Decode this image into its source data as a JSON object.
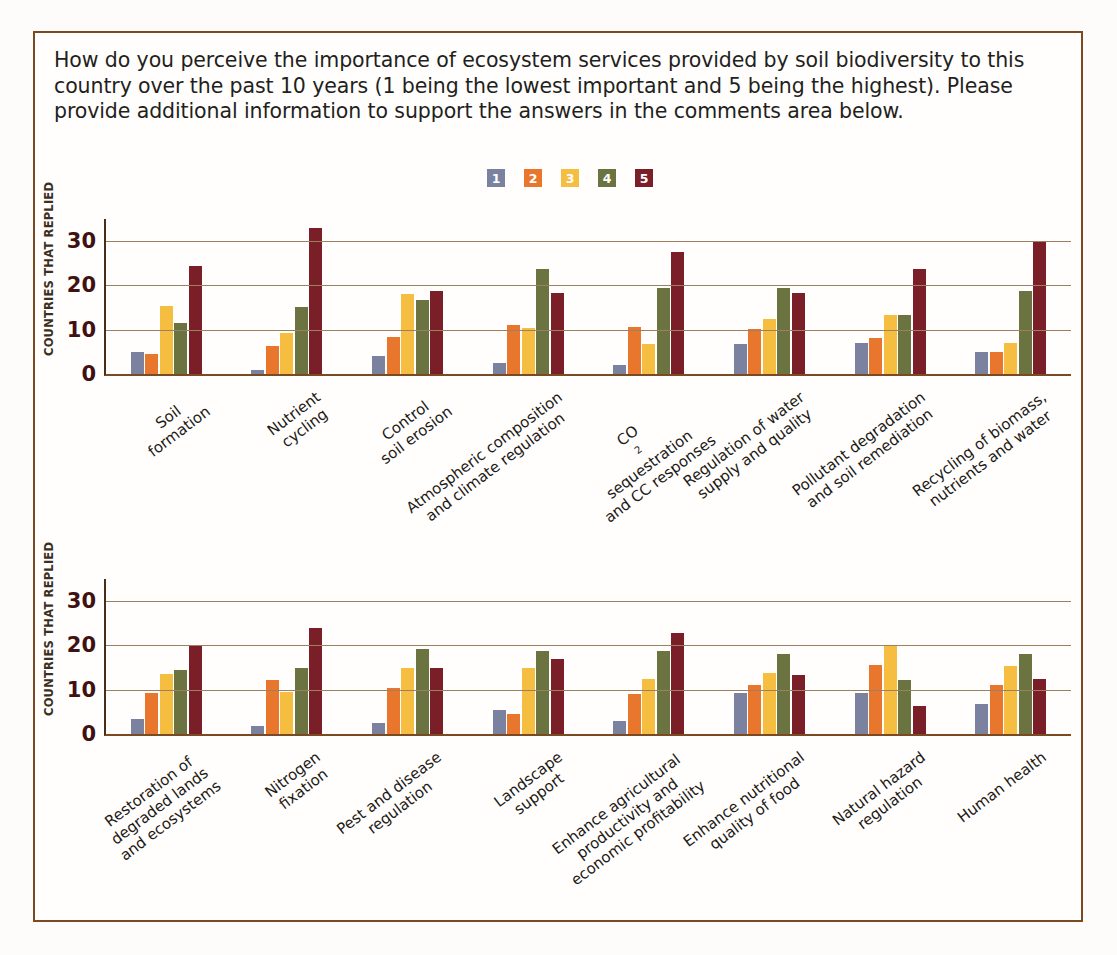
{
  "question": "How do you perceive the importance of ecosystem services provided by soil biodiversity to this country over the past 10 years (1 being the lowest important and 5 being the highest). Please provide additional information to support the answers in the comments area below.",
  "legend": {
    "entries": [
      {
        "label": "1",
        "color": "#7b82a0"
      },
      {
        "label": "2",
        "color": "#e8762c"
      },
      {
        "label": "3",
        "color": "#f5be41"
      },
      {
        "label": "4",
        "color": "#6b7340"
      },
      {
        "label": "5",
        "color": "#7a1f28"
      }
    ]
  },
  "axis": {
    "y_title": "COUNTRIES THAT REPLIED",
    "ticks": [
      "0",
      "10",
      "20",
      "30"
    ]
  },
  "chart_data": [
    {
      "type": "bar",
      "title": "",
      "xlabel": "",
      "ylabel": "COUNTRIES THAT REPLIED",
      "ylim": [
        0,
        35
      ],
      "yticks": [
        0,
        10,
        20,
        30
      ],
      "grid": true,
      "legend_position": "top-center",
      "categories": [
        "Soil formation",
        "Nutrient cycling",
        "Control soil erosion",
        "Atmospheric composition and climate regulation",
        "CO2 sequestration and CC responses",
        "Regulation of water supply and quality",
        "Pollutant degradation and soil remediation",
        "Recycling of biomass, nutrients and water"
      ],
      "series": [
        {
          "name": "1",
          "color": "#7b82a0",
          "values": [
            5.0,
            1.0,
            4.0,
            2.5,
            2.0,
            6.8,
            7.0,
            5.0
          ]
        },
        {
          "name": "2",
          "color": "#e8762c",
          "values": [
            4.5,
            6.3,
            8.3,
            11.0,
            10.7,
            10.2,
            8.2,
            5.0
          ]
        },
        {
          "name": "3",
          "color": "#f5be41",
          "values": [
            15.3,
            9.3,
            18.0,
            10.3,
            6.8,
            12.4,
            13.4,
            7.0
          ]
        },
        {
          "name": "4",
          "color": "#6b7340",
          "values": [
            11.5,
            15.2,
            16.7,
            23.8,
            19.4,
            19.4,
            13.4,
            18.8
          ]
        },
        {
          "name": "5",
          "color": "#7a1f28",
          "values": [
            24.5,
            33.0,
            18.7,
            18.3,
            27.6,
            18.4,
            23.8,
            29.8
          ]
        }
      ]
    },
    {
      "type": "bar",
      "title": "",
      "xlabel": "",
      "ylabel": "COUNTRIES THAT REPLIED",
      "ylim": [
        0,
        35
      ],
      "yticks": [
        0,
        10,
        20,
        30
      ],
      "grid": true,
      "legend_position": "top-center",
      "categories": [
        "Restoration of degraded lands and ecosystems",
        "Nitrogen fixation",
        "Pest and disease regulation",
        "Landscape support",
        "Enhance agricultural productivity and economic profitability",
        "Enhance nutritional quality of food",
        "Natural hazard regulation",
        "Human health"
      ],
      "series": [
        {
          "name": "1",
          "color": "#7b82a0",
          "values": [
            3.4,
            1.7,
            2.4,
            5.4,
            2.9,
            9.3,
            9.3,
            6.8
          ]
        },
        {
          "name": "2",
          "color": "#e8762c",
          "values": [
            9.3,
            12.3,
            10.5,
            4.5,
            9.0,
            11.0,
            15.5,
            11.0
          ]
        },
        {
          "name": "3",
          "color": "#f5be41",
          "values": [
            13.6,
            9.5,
            15.0,
            15.0,
            12.4,
            13.8,
            20.0,
            15.3
          ]
        },
        {
          "name": "4",
          "color": "#6b7340",
          "values": [
            14.5,
            14.9,
            19.2,
            18.8,
            18.7,
            18.0,
            12.3,
            18.0
          ]
        },
        {
          "name": "5",
          "color": "#7a1f28",
          "values": [
            20.0,
            24.0,
            14.8,
            16.9,
            22.7,
            13.3,
            6.3,
            12.5
          ]
        }
      ]
    }
  ],
  "xlabels_chart1": [
    [
      "Soil",
      "formation"
    ],
    [
      "Nutrient",
      "cycling"
    ],
    [
      "Control",
      "soil erosion"
    ],
    [
      "Atmospheric composition",
      "and climate regulation"
    ],
    [
      "CO₂ sequestration",
      "and CC responses"
    ],
    [
      "Regulation of water",
      "supply and quality"
    ],
    [
      "Pollutant degradation",
      "and soil remediation"
    ],
    [
      "Recycling of biomass,",
      "nutrients and water"
    ]
  ],
  "xlabels_chart2": [
    [
      "Restoration of",
      "degraded lands",
      "and ecosystems"
    ],
    [
      "Nitrogen",
      "fixation"
    ],
    [
      "Pest and disease",
      "regulation"
    ],
    [
      "Landscape",
      "support"
    ],
    [
      "Enhance agricultural",
      "productivity and",
      "economic profitability"
    ],
    [
      "Enhance nutritional",
      "quality of food"
    ],
    [
      "Natural hazard",
      "regulation"
    ],
    [
      "Human health"
    ]
  ]
}
